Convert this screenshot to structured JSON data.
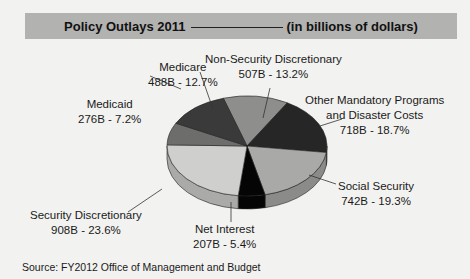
{
  "header": {
    "title": "Policy Outlays 2011",
    "subtitle": "(in billions of dollars)",
    "background": "#b2b2b0"
  },
  "source": "Source: FY2012 Office of Management and Budget",
  "chart_data": {
    "type": "pie",
    "title": "Policy Outlays 2011",
    "subtitle": "(in billions of dollars)",
    "units": "billions of dollars",
    "style": "3d",
    "legend": "none (direct labels with leader lines)",
    "slices": [
      {
        "name": "Non-Security Discretionary",
        "value": 507,
        "percent": 13.2,
        "label_value": "507B - 13.2%",
        "color": "#8e8e8c"
      },
      {
        "name": "Other Mandatory Programs and Disaster Costs",
        "value": 718,
        "percent": 18.7,
        "label_value": "718B - 18.7%",
        "color": "#262626"
      },
      {
        "name": "Social Security",
        "value": 742,
        "percent": 19.3,
        "label_value": "742B - 19.3%",
        "color": "#a9a9a7"
      },
      {
        "name": "Net Interest",
        "value": 207,
        "percent": 5.4,
        "label_value": "207B - 5.4%",
        "color": "#050505"
      },
      {
        "name": "Security Discretionary",
        "value": 908,
        "percent": 23.6,
        "label_value": "908B - 23.6%",
        "color": "#cfcfcd"
      },
      {
        "name": "Medicaid",
        "value": 276,
        "percent": 7.2,
        "label_value": "276B - 7.2%",
        "color": "#6d6d6b"
      },
      {
        "name": "Medicare",
        "value": 488,
        "percent": 12.7,
        "label_value": "488B - 12.7%",
        "color": "#3a3a3a"
      }
    ],
    "total_percent": 100.1
  },
  "labels": {
    "medicare": {
      "name": "Medicare",
      "value": "488B - 12.7%"
    },
    "medicaid": {
      "name": "Medicaid",
      "value": "276B - 7.2%"
    },
    "nonsec": {
      "name": "Non-Security Discretionary",
      "value": "507B - 13.2%"
    },
    "other": {
      "line1": "Other Mandatory Programs",
      "line2": "and Disaster Costs",
      "value": "718B - 18.7%"
    },
    "secdisc": {
      "name": "Security Discretionary",
      "value": "908B - 23.6%"
    },
    "social": {
      "name": "Social Security",
      "value": "742B - 19.3%"
    },
    "netint": {
      "name": "Net Interest",
      "value": "207B - 5.4%"
    }
  }
}
